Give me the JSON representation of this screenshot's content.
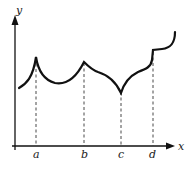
{
  "figure": {
    "type": "function-graph",
    "axes": {
      "x_label": "x",
      "y_label": "y"
    },
    "ticks": [
      {
        "label": "a",
        "x": 36,
        "feature": "cusp (sharp peak)"
      },
      {
        "label": "b",
        "x": 84,
        "feature": "corner (peak)"
      },
      {
        "label": "c",
        "x": 121,
        "feature": "cusp (sharp valley)"
      },
      {
        "label": "d",
        "x": 152,
        "feature": "jump discontinuity"
      }
    ],
    "colors": {
      "curve": "#111111",
      "axes": "#111111",
      "guides": "#333333",
      "background": "#ffffff"
    }
  }
}
